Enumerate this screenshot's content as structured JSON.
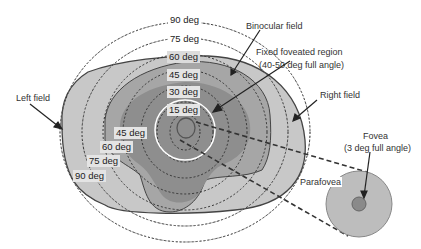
{
  "diagram": {
    "colors": {
      "outer_field": "#c8c8c8",
      "binocular_field": "#a6a6a6",
      "inner_field": "#8e8e8e",
      "fovea": "#8a8a8a",
      "parafovea": "#bdbdbd",
      "fixed_region_ring": "#ffffff",
      "outline": "#444444"
    },
    "ring_labels_upper": [
      "90 deg",
      "75 deg",
      "60 deg",
      "45 deg",
      "30 deg",
      "15 deg"
    ],
    "ring_labels_lower": [
      "45 deg",
      "60 deg",
      "75 deg",
      "90 deg"
    ],
    "callouts": {
      "binocular_field": "Binocular field",
      "fixed_region_line1": "Fixed foveated region",
      "fixed_region_line2": "(40-50 deg full angle)",
      "left_field": "Left field",
      "right_field": "Right field",
      "fovea_line1": "Fovea",
      "fovea_line2": "(3 deg full angle)",
      "parafovea": "Parafovea"
    }
  }
}
